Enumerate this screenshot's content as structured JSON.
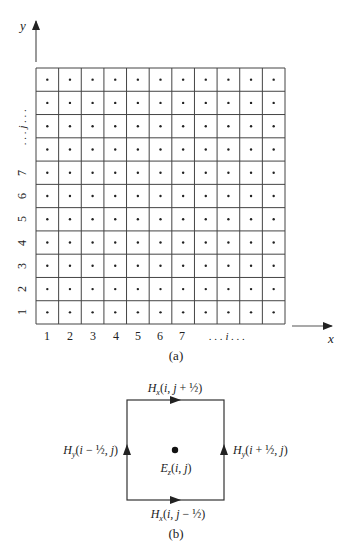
{
  "figure_a": {
    "caption": "(a)",
    "grid": {
      "cols": 11,
      "rows": 11,
      "cell_dot": true
    },
    "axes": {
      "x_label": "x",
      "y_label": "y"
    },
    "x_ticks": [
      "1",
      "2",
      "3",
      "4",
      "5",
      "6",
      "7",
      ". . . i . . ."
    ],
    "y_ticks": [
      "1",
      "2",
      "3",
      "4",
      "5",
      "6",
      "7",
      ". . . j . . ."
    ]
  },
  "figure_b": {
    "caption": "(b)",
    "top_label": "Hx(i, j + 1/2)",
    "bottom_label": "Hx(i, j − 1/2)",
    "left_label": "Hy(i − 1/2, j)",
    "right_label": "Hy(i + 1/2, j)",
    "center_label": "Ez(i, j)"
  },
  "colors": {
    "line": "#333333",
    "text": "#222222"
  }
}
